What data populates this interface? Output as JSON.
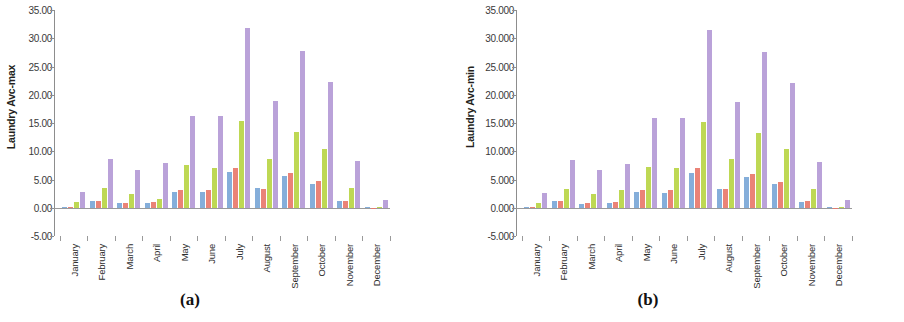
{
  "figure": {
    "panels": [
      {
        "caption": "(a)",
        "ylabel": "Laundry Avc-max",
        "yticks": [
          "35.00",
          "30.00",
          "25.00",
          "20.00",
          "15.00",
          "10.00",
          "5.00",
          "0.00",
          "-5.00"
        ]
      },
      {
        "caption": "(b)",
        "ylabel": "Laundry Avc-min",
        "yticks": [
          "35.000",
          "30.000",
          "25.000",
          "20.000",
          "15.000",
          "10.000",
          "5.000",
          "0.000",
          "-5.000"
        ]
      }
    ]
  },
  "colors": {
    "series1": "#7ba7d7",
    "series2": "#e8786b",
    "series3": "#b8d545",
    "series4": "#b49ad6",
    "axis": "#8d8d8d",
    "text": "#2e2e2e"
  },
  "chart_data": [
    {
      "type": "bar",
      "title": "(a)",
      "xlabel": "",
      "ylabel": "Laundry Avc-max",
      "ylim": [
        -5.0,
        35.0
      ],
      "ytick_values": [
        35.0,
        30.0,
        25.0,
        20.0,
        15.0,
        10.0,
        5.0,
        0.0,
        -5.0
      ],
      "grid": false,
      "legend": "none",
      "categories": [
        "January",
        "February",
        "March",
        "April",
        "May",
        "June",
        "July",
        "August",
        "September",
        "October",
        "November",
        "December"
      ],
      "series": [
        {
          "name": "series1",
          "color": "#7ba7d7",
          "values": [
            0.1,
            1.3,
            0.8,
            0.9,
            2.9,
            2.9,
            6.4,
            3.5,
            5.6,
            4.3,
            1.2,
            0.0
          ]
        },
        {
          "name": "series2",
          "color": "#e8786b",
          "values": [
            0.1,
            1.3,
            0.9,
            1.1,
            3.2,
            3.2,
            7.1,
            3.4,
            6.2,
            4.8,
            1.2,
            -0.2
          ]
        },
        {
          "name": "series3",
          "color": "#b8d545",
          "values": [
            1.0,
            3.5,
            2.5,
            1.6,
            7.6,
            7.1,
            15.3,
            8.7,
            13.4,
            10.4,
            3.5,
            0.1
          ]
        },
        {
          "name": "series4",
          "color": "#b49ad6",
          "values": [
            2.8,
            8.7,
            6.8,
            7.9,
            16.3,
            16.2,
            31.9,
            18.9,
            27.8,
            22.3,
            8.3,
            1.5
          ]
        }
      ]
    },
    {
      "type": "bar",
      "title": "(b)",
      "xlabel": "",
      "ylabel": "Laundry Avc-min",
      "ylim": [
        -5.0,
        35.0
      ],
      "ytick_values": [
        35.0,
        30.0,
        25.0,
        20.0,
        15.0,
        10.0,
        5.0,
        0.0,
        -5.0
      ],
      "grid": false,
      "legend": "none",
      "categories": [
        "January",
        "February",
        "March",
        "April",
        "May",
        "June",
        "July",
        "August",
        "September",
        "October",
        "November",
        "December"
      ],
      "series": [
        {
          "name": "series1",
          "color": "#7ba7d7",
          "values": [
            0.1,
            1.2,
            0.7,
            0.9,
            2.8,
            2.6,
            6.2,
            3.4,
            5.5,
            4.2,
            1.1,
            0.0
          ]
        },
        {
          "name": "series2",
          "color": "#e8786b",
          "values": [
            0.1,
            1.3,
            0.8,
            1.0,
            3.1,
            3.1,
            7.0,
            3.3,
            6.0,
            4.6,
            1.2,
            -0.2
          ]
        },
        {
          "name": "series3",
          "color": "#b8d545",
          "values": [
            0.9,
            3.4,
            2.4,
            3.1,
            7.3,
            7.0,
            15.2,
            8.6,
            13.2,
            10.4,
            3.4,
            0.1
          ]
        },
        {
          "name": "series4",
          "color": "#b49ad6",
          "values": [
            2.7,
            8.4,
            6.7,
            7.7,
            16.0,
            16.0,
            31.5,
            18.7,
            27.6,
            22.1,
            8.1,
            1.4
          ]
        }
      ]
    }
  ]
}
